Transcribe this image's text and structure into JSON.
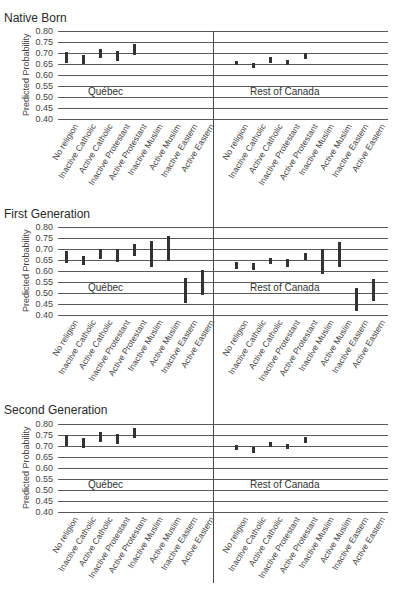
{
  "chart_data": {
    "type": "errorbar",
    "ylabel": "Predicted Probability",
    "ylim": [
      0.4,
      0.8
    ],
    "yticks": [
      "0.80",
      "0.75",
      "0.70",
      "0.65",
      "0.60",
      "0.55",
      "0.50",
      "0.45",
      "0.40"
    ],
    "grid": true,
    "categories": [
      "No religion",
      "Inactive Catholic",
      "Active Catholic",
      "Inactive Protestant",
      "Active Protestant",
      "Inactive Muslim",
      "Active Muslim",
      "Inactive Eastern",
      "Active Eastern"
    ],
    "panels": [
      {
        "title": "Native Born",
        "regions": [
          {
            "name": "Québec",
            "intervals": [
              [
                0.655,
                0.705
              ],
              [
                0.65,
                0.69
              ],
              [
                0.675,
                0.72
              ],
              [
                0.665,
                0.71
              ],
              [
                0.69,
                0.74
              ],
              null,
              null,
              null,
              null
            ]
          },
          {
            "name": "Rest of Canada",
            "intervals": [
              [
                0.645,
                0.665
              ],
              [
                0.63,
                0.655
              ],
              [
                0.655,
                0.68
              ],
              [
                0.645,
                0.67
              ],
              [
                0.675,
                0.7
              ],
              null,
              null,
              null,
              null
            ]
          }
        ]
      },
      {
        "title": "First Generation",
        "regions": [
          {
            "name": "Québec",
            "intervals": [
              [
                0.635,
                0.69
              ],
              [
                0.625,
                0.67
              ],
              [
                0.655,
                0.7
              ],
              [
                0.64,
                0.7
              ],
              [
                0.67,
                0.725
              ],
              [
                0.62,
                0.735
              ],
              [
                0.645,
                0.76
              ],
              [
                0.455,
                0.57
              ],
              [
                0.49,
                0.605
              ]
            ]
          },
          {
            "name": "Rest of Canada",
            "intervals": [
              [
                0.61,
                0.64
              ],
              [
                0.605,
                0.635
              ],
              [
                0.63,
                0.66
              ],
              [
                0.62,
                0.655
              ],
              [
                0.65,
                0.68
              ],
              [
                0.585,
                0.7
              ],
              [
                0.62,
                0.73
              ],
              [
                0.42,
                0.525
              ],
              [
                0.465,
                0.565
              ]
            ]
          }
        ]
      },
      {
        "title": "Second Generation",
        "regions": [
          {
            "name": "Québec",
            "intervals": [
              [
                0.7,
                0.75
              ],
              [
                0.69,
                0.735
              ],
              [
                0.72,
                0.765
              ],
              [
                0.71,
                0.755
              ],
              [
                0.735,
                0.78
              ],
              null,
              null,
              null,
              null
            ]
          },
          {
            "name": "Rest of Canada",
            "intervals": [
              [
                0.68,
                0.705
              ],
              [
                0.67,
                0.695
              ],
              [
                0.695,
                0.72
              ],
              [
                0.685,
                0.71
              ],
              [
                0.715,
                0.74
              ],
              null,
              null,
              null,
              null
            ]
          }
        ]
      }
    ]
  }
}
